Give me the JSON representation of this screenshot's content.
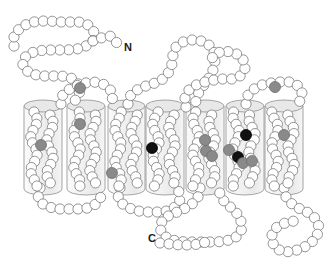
{
  "figure": {
    "background_color": "#ffffff",
    "type": "snake-plot"
  },
  "terminals": {
    "n_label": "N",
    "n_x": 124,
    "n_y": 51,
    "c_label": "C",
    "c_x": 148,
    "c_y": 242
  },
  "style": {
    "residue_fill": "#ffffff",
    "residue_stroke": "#7a7a7a",
    "residue_radius": 5.1,
    "residue_stroke_width": 0.8,
    "highlight_gray": "#8a8a8a",
    "highlight_black": "#111111",
    "cylinder_fill": "#f2f2f2",
    "cylinder_stroke": "#9a9a9a",
    "cylinder_top_fill": "#e8e8e8"
  },
  "membrane": {
    "top_y": 106,
    "bottom_y": 189,
    "helix_count": 7
  },
  "helices": [
    {
      "id": "TM1",
      "x": 24,
      "width": 38
    },
    {
      "id": "TM2",
      "x": 67,
      "width": 38
    },
    {
      "id": "TM3",
      "x": 108,
      "width": 37
    },
    {
      "id": "TM4",
      "x": 146,
      "width": 38
    },
    {
      "id": "TM5",
      "x": 186,
      "width": 38
    },
    {
      "id": "TM6",
      "x": 226,
      "width": 38
    },
    {
      "id": "TM7",
      "x": 265,
      "width": 38
    }
  ],
  "highlighted_residues": [
    {
      "id": "h1",
      "x": 41,
      "y": 145,
      "color": "gray",
      "helix": "TM1"
    },
    {
      "id": "h2",
      "x": 80,
      "y": 88,
      "color": "gray",
      "helix": "loop-N-TM2"
    },
    {
      "id": "h3",
      "x": 80,
      "y": 124,
      "color": "gray",
      "helix": "TM2"
    },
    {
      "id": "h4",
      "x": 112,
      "y": 173,
      "color": "gray",
      "helix": "TM3"
    },
    {
      "id": "h5",
      "x": 152,
      "y": 148,
      "color": "black",
      "helix": "TM4"
    },
    {
      "id": "h6",
      "x": 205,
      "y": 140,
      "color": "gray",
      "helix": "TM5"
    },
    {
      "id": "h7",
      "x": 206,
      "y": 151,
      "color": "gray",
      "helix": "TM5"
    },
    {
      "id": "h8",
      "x": 212,
      "y": 156,
      "color": "gray",
      "helix": "TM5"
    },
    {
      "id": "h9",
      "x": 246,
      "y": 135,
      "color": "black",
      "helix": "TM6"
    },
    {
      "id": "h10",
      "x": 229,
      "y": 150,
      "color": "gray",
      "helix": "TM6"
    },
    {
      "id": "h11",
      "x": 238,
      "y": 157,
      "color": "black",
      "helix": "TM6"
    },
    {
      "id": "h12",
      "x": 243,
      "y": 163,
      "color": "gray",
      "helix": "TM6"
    },
    {
      "id": "h13",
      "x": 252,
      "y": 161,
      "color": "gray",
      "helix": "TM6"
    },
    {
      "id": "h14",
      "x": 275,
      "y": 87,
      "color": "gray",
      "helix": "loop-TM6-TM7"
    },
    {
      "id": "h15",
      "x": 284,
      "y": 135,
      "color": "gray",
      "helix": "TM7"
    }
  ],
  "chain_segments": [
    {
      "name": "n-terminal-tail",
      "points": "14,46 14,35 20,28 29,23 39,21 49,21 59,22 69,22 79,22 88,25 94,32 93,41 86,46 77,49 67,50 57,50 47,50 37,51 28,54 22,61 24,69 32,74 42,76 52,76 62,76 71,78 78,83 80,91 77,99 70,104"
    },
    {
      "name": "n-terminal-approach",
      "points": "93,41 101,38 110,36 119,45"
    },
    {
      "name": "loop-tm1-tm2-top",
      "points": "61,104 62,96 68,90 76,86 85,83 94,82 103,84 110,89 113,97 110,104"
    },
    {
      "name": "loop-tm2-tm3-bottom",
      "points": "40,188 38,196 41,203 49,207 58,209 68,209 78,209 88,208 96,204 101,197 100,189"
    },
    {
      "name": "loop-tm3-tm4-top",
      "points": "128,104 130,96 137,90 146,86 155,83 163,79 169,72 172,64 173,55 176,47 183,42 192,40 201,41 209,45 214,52 215,61 213,70 209,78 204,85 199,92 196,100 195,107"
    },
    {
      "name": "loop-tm4-tm5-bottom",
      "points": "120,188 118,196 121,203 129,208 138,211 148,212 158,212 167,211 175,207 180,200 179,192 176,186"
    },
    {
      "name": "loop-tm5-tm6-top",
      "points": "186,107 185,98 189,90 196,85 205,82 214,80 223,79 232,79 240,76 245,69 244,61 239,55 232,52 223,51 215,54 210,61"
    },
    {
      "name": "loop-tm6-tm7-top",
      "points": "246,104 248,95 254,89 262,85 271,83 280,82 289,82 297,85 302,92 301,100 296,105"
    },
    {
      "name": "c-terminal-tail",
      "points": "200,188 198,197 192,204 184,209 175,213 166,217 160,224 161,232 167,238 176,241 186,242 196,242 206,242 216,242 226,241 235,238 241,232 242,224 239,216 234,210 228,205 222,199 219,191"
    },
    {
      "name": "c-terminal-segment",
      "points": "160,243 170,244 180,245 190,245 200,244 209,241"
    },
    {
      "name": "right-bottom-loop",
      "points": "284,188 286,197 292,204 300,209 309,213 316,219 319,227 317,236 311,243 303,248 294,251 285,252 277,249 272,242 272,234 277,227 285,223 294,221"
    }
  ],
  "residue_chains": {
    "description": "Each transmembrane helix contains a double-stranded zigzag of residue circles",
    "per_helix_residue_count": 26
  }
}
